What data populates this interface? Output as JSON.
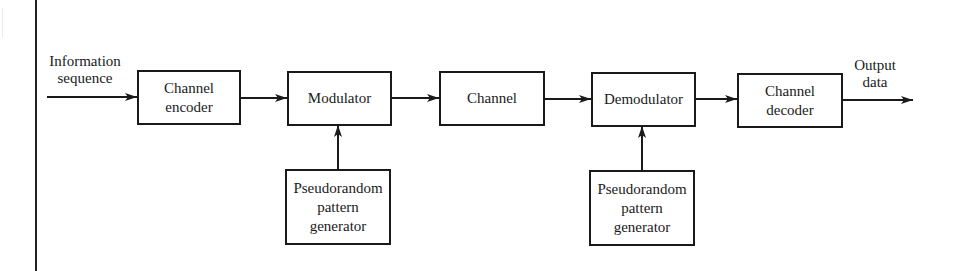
{
  "diagram": {
    "input_label": "Information\nsequence",
    "output_label": "Output\ndata",
    "blocks": {
      "channel_encoder": "Channel\nencoder",
      "modulator": "Modulator",
      "channel": "Channel",
      "demodulator": "Demodulator",
      "channel_decoder": "Channel\ndecoder",
      "pn_generator_tx": "Pseudorandom\npattern\ngenerator",
      "pn_generator_rx": "Pseudorandom\npattern\ngenerator"
    },
    "connections": [
      {
        "from": "input",
        "to": "channel_encoder"
      },
      {
        "from": "channel_encoder",
        "to": "modulator"
      },
      {
        "from": "modulator",
        "to": "channel"
      },
      {
        "from": "channel",
        "to": "demodulator"
      },
      {
        "from": "demodulator",
        "to": "channel_decoder"
      },
      {
        "from": "channel_decoder",
        "to": "output"
      },
      {
        "from": "pn_generator_tx",
        "to": "modulator"
      },
      {
        "from": "pn_generator_rx",
        "to": "demodulator"
      }
    ],
    "colors": {
      "stroke": "#1a1a1a",
      "background": "#ffffff"
    }
  }
}
